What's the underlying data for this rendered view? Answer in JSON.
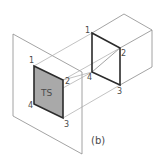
{
  "figure": {
    "caption": "(b)",
    "surface_label": "TS",
    "panel_points": {
      "p1": "1",
      "p2": "2",
      "p3": "3",
      "p4": "4"
    },
    "cube_points": {
      "p1": "1",
      "p2": "2",
      "p3": "3",
      "p4": "4"
    },
    "colors": {
      "surface_fill": "#a9a9a9",
      "thin_line": "#8c8c8c",
      "bold_line": "#2b2b2b",
      "background": "#ffffff"
    }
  }
}
